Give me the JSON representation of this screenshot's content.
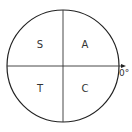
{
  "diagram": {
    "type": "CAST diagram",
    "quadrants": {
      "top_left": "S",
      "top_right": "A",
      "bottom_left": "T",
      "bottom_right": "C"
    },
    "axis_label": "0°",
    "colors": {
      "stroke": "#222222",
      "text": "#333333",
      "background": "#ffffff"
    }
  }
}
